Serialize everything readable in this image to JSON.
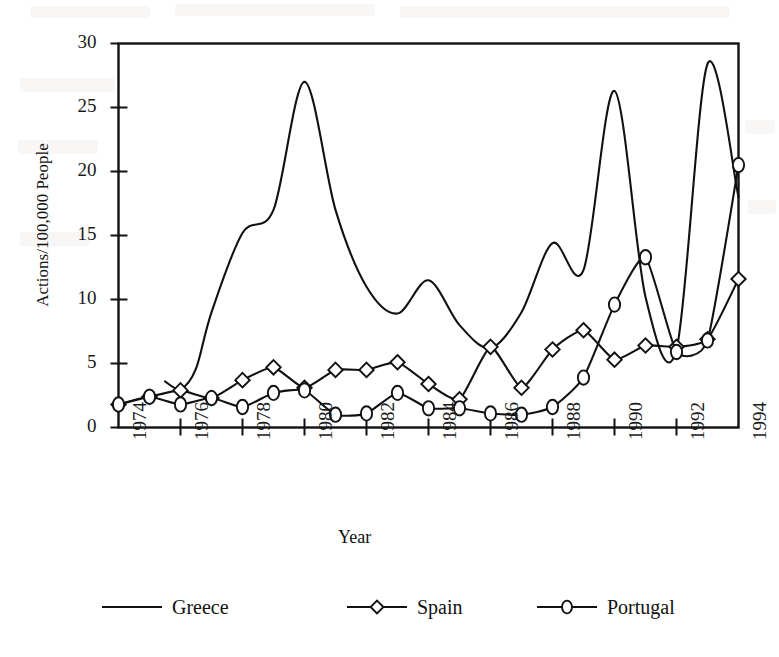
{
  "chart_data": {
    "type": "line",
    "title": "",
    "xlabel": "Year",
    "ylabel": "Actions/100,000 People",
    "xlim": [
      1974,
      1994
    ],
    "ylim": [
      0,
      30
    ],
    "xticks": [
      1974,
      1976,
      1978,
      1980,
      1982,
      1984,
      1986,
      1988,
      1990,
      1992,
      1994
    ],
    "yticks": [
      0,
      5,
      10,
      15,
      20,
      25,
      30
    ],
    "grid": false,
    "legend_position": "bottom",
    "x": [
      1974,
      1975,
      1976,
      1977,
      1978,
      1979,
      1980,
      1981,
      1982,
      1983,
      1984,
      1985,
      1986,
      1987,
      1988,
      1989,
      1990,
      1991,
      1992,
      1993,
      1994
    ],
    "series": [
      {
        "name": "Greece",
        "marker": "none",
        "x": [
          1975.5,
          1976,
          1976.5,
          1977,
          1978,
          1979,
          1980,
          1981,
          1982,
          1983,
          1984,
          1985,
          1986,
          1987,
          1988,
          1989,
          1990,
          1991,
          1992,
          1993,
          1994
        ],
        "values": [
          3.6,
          3.0,
          4.6,
          9.0,
          15.2,
          17.0,
          27.0,
          17.0,
          11.0,
          8.9,
          11.5,
          8.0,
          6.2,
          9.0,
          14.4,
          12.3,
          26.3,
          10.2,
          6.1,
          28.4,
          18.0
        ]
      },
      {
        "name": "Spain",
        "marker": "diamond",
        "values": [
          1.8,
          2.4,
          2.9,
          2.3,
          3.7,
          4.7,
          3.1,
          4.5,
          4.5,
          5.1,
          3.4,
          2.2,
          6.3,
          3.1,
          6.1,
          7.6,
          5.3,
          6.4,
          6.3,
          6.9,
          11.6
        ]
      },
      {
        "name": "Portugal",
        "marker": "circle",
        "values": [
          1.8,
          2.4,
          1.8,
          2.3,
          1.6,
          2.7,
          2.9,
          1.0,
          1.1,
          2.7,
          1.5,
          1.5,
          1.1,
          1.0,
          1.6,
          3.9,
          9.6,
          13.3,
          5.9,
          6.8,
          20.5
        ]
      }
    ]
  },
  "legend": {
    "items": [
      {
        "label": "Greece",
        "marker": "none"
      },
      {
        "label": "Spain",
        "marker": "diamond"
      },
      {
        "label": "Portugal",
        "marker": "circle"
      }
    ]
  }
}
